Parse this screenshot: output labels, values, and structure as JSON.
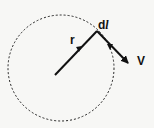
{
  "diagram": {
    "title": "",
    "labels": {
      "radius_vector": "r",
      "line_element_d": "d",
      "line_element_l": "l",
      "velocity": "V"
    },
    "colors": {
      "stroke": "#111111",
      "background": "#f7f7f5"
    },
    "circle": {
      "cx": 61,
      "cy": 68,
      "r": 53,
      "style": "dashed"
    },
    "arrows": [
      {
        "name": "r",
        "from": [
          55,
          75
        ],
        "to": [
          97,
          31
        ]
      },
      {
        "name": "V",
        "from": [
          97,
          31
        ],
        "to": [
          130,
          65
        ]
      }
    ]
  }
}
